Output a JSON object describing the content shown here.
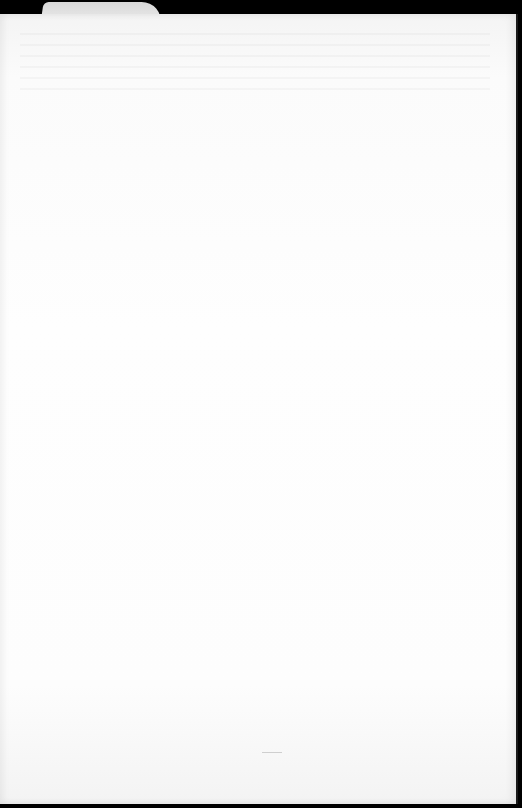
{
  "document": {
    "type": "blank paper sheet",
    "tab_label": "",
    "body_text": "",
    "colors": {
      "background": "#000000",
      "paper": "#fdfdfd",
      "tab": "#e2e2e2"
    }
  }
}
